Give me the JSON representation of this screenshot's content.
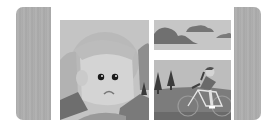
{
  "carousel": {
    "type": "image-gallery",
    "prev_slide": {
      "label": "",
      "icon": "image-placeholder-strip"
    },
    "next_slide": {
      "label": "",
      "icon": "image-placeholder-strip"
    },
    "slides": [
      {
        "name": "sad-face-illustration",
        "alt": ""
      },
      {
        "name": "clouds-illustration",
        "alt": ""
      },
      {
        "name": "cyclist-illustration",
        "alt": ""
      }
    ]
  },
  "colors": {
    "background": "#ffffff",
    "strip": "#adadad",
    "panel_light": "#c6c6c6",
    "dark_gray": "#6e6e6e",
    "mid_gray": "#8a8a8a",
    "skin": "#d6d6d6",
    "eye": "#1a1a1a"
  }
}
